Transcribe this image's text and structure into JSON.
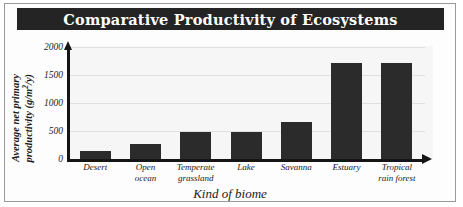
{
  "chart_data": {
    "type": "bar",
    "title": "Comparative Productivity of Ecosystems",
    "xlabel": "Kind of biome",
    "ylabel": "Average net primary productivity (g/m²/y)",
    "ylabel_line1": "Average net primary",
    "ylabel_line2_pre": "productivity (g/m",
    "ylabel_line2_sup": "2",
    "ylabel_line2_post": "/y)",
    "categories": [
      "Desert",
      "Open ocean",
      "Temperate grassland",
      "Lake",
      "Savanna",
      "Estuary",
      "Tropical rain forest"
    ],
    "category_lines": [
      [
        "Desert"
      ],
      [
        "Open",
        "ocean"
      ],
      [
        "Temperate",
        "grassland"
      ],
      [
        "Lake"
      ],
      [
        "Savanna"
      ],
      [
        "Estuary"
      ],
      [
        "Tropical",
        "rain forest"
      ]
    ],
    "values": [
      140,
      260,
      490,
      490,
      670,
      1710,
      1710
    ],
    "ylim": [
      0,
      2000
    ],
    "yticks": [
      0,
      500,
      1000,
      1500,
      2000
    ],
    "ytick_labels": [
      "0",
      "500",
      "1000",
      "1500",
      "2000"
    ],
    "grid": true,
    "legend": "none",
    "colors": {
      "bar": "#2b2b2b",
      "title_bar_bg": "#242424",
      "title_text": "#ffffff",
      "plot_bg": "#f6f6f6",
      "gridline": "#e0e0e0",
      "axis": "#151515",
      "frame_border": "#9a9a9a",
      "page_bg": "#ffffff"
    }
  }
}
